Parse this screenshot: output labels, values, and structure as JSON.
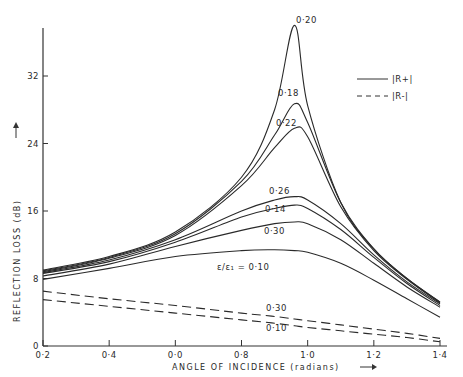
{
  "chart_data": {
    "type": "line",
    "title": "",
    "xlabel": "ANGLE OF INCIDENCE (radians)",
    "ylabel": "REFLECTION LOSS (dB)",
    "xlim": [
      0.2,
      1.4
    ],
    "ylim": [
      0,
      38
    ],
    "x_ticks": [
      0.2,
      0.4,
      0.6,
      0.8,
      1.0,
      1.2,
      1.4
    ],
    "x_tick_labels": [
      "0·2",
      "0·4",
      "0·0",
      "0·8",
      "1·0",
      "1·2",
      "1·4"
    ],
    "y_ticks": [
      0,
      8,
      16,
      24,
      32
    ],
    "y_tick_labels": [
      "0",
      "8",
      "16",
      "24",
      "32"
    ],
    "grid": false,
    "legend": {
      "position": "upper right",
      "entries": [
        {
          "label": "|R+|",
          "style": "solid"
        },
        {
          "label": "|R-|",
          "style": "dashed"
        }
      ]
    },
    "annotation_prefix": "ε/ε₁ = ",
    "x": [
      0.2,
      0.4,
      0.6,
      0.8,
      0.9,
      0.96,
      1.0,
      1.1,
      1.2,
      1.3,
      1.4
    ],
    "series": [
      {
        "name": "0·20",
        "component": "|R+|",
        "style": "solid",
        "values": [
          9.0,
          10.6,
          13.5,
          20.0,
          28.0,
          38.0,
          28.5,
          17.0,
          11.5,
          8.0,
          5.2
        ]
      },
      {
        "name": "0·18",
        "component": "|R+|",
        "style": "solid",
        "values": [
          8.9,
          10.5,
          13.3,
          19.5,
          25.0,
          28.7,
          26.5,
          17.0,
          11.5,
          8.0,
          5.2
        ]
      },
      {
        "name": "0·22",
        "component": "|R+|",
        "style": "solid",
        "values": [
          8.8,
          10.4,
          13.1,
          19.0,
          23.5,
          25.8,
          24.8,
          16.5,
          11.3,
          7.9,
          5.1
        ]
      },
      {
        "name": "0·26",
        "component": "|R+|",
        "style": "solid",
        "values": [
          8.7,
          10.2,
          12.6,
          16.0,
          17.3,
          17.7,
          17.3,
          14.5,
          10.8,
          7.6,
          5.0
        ]
      },
      {
        "name": "0·14",
        "component": "|R+|",
        "style": "solid",
        "values": [
          8.6,
          10.0,
          12.3,
          15.3,
          16.3,
          16.7,
          16.3,
          13.8,
          10.5,
          7.4,
          4.8
        ]
      },
      {
        "name": "0·30",
        "component": "|R+|",
        "style": "solid",
        "values": [
          8.3,
          9.7,
          11.8,
          13.7,
          14.5,
          14.7,
          14.5,
          12.6,
          9.8,
          7.0,
          4.6
        ]
      },
      {
        "name": "0·10",
        "component": "|R+|",
        "style": "solid",
        "values": [
          7.9,
          9.2,
          10.6,
          11.3,
          11.4,
          11.3,
          11.1,
          9.8,
          7.8,
          5.6,
          3.4
        ]
      },
      {
        "name": "0·30",
        "component": "|R-|",
        "style": "dashed",
        "values": [
          6.5,
          5.6,
          4.8,
          3.9,
          3.5,
          3.2,
          3.0,
          2.5,
          2.0,
          1.5,
          0.9
        ]
      },
      {
        "name": "0·10",
        "component": "|R-|",
        "style": "dashed",
        "values": [
          5.5,
          4.7,
          3.9,
          3.1,
          2.7,
          2.4,
          2.2,
          1.8,
          1.4,
          1.0,
          0.5
        ]
      }
    ]
  }
}
